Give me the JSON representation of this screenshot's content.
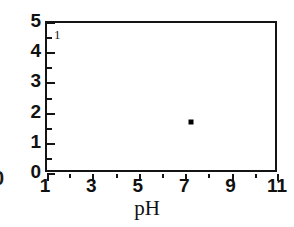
{
  "figure": {
    "panel_label": "1",
    "edge_remnant_text": "0",
    "marker_color": "#000000",
    "axis_color": "#141414",
    "background": "#ffffff"
  },
  "chart_data": {
    "type": "scatter",
    "title": "",
    "subtitle": "",
    "xlabel": "pH",
    "ylabel": "",
    "xlim": [
      1,
      11
    ],
    "ylim": [
      0,
      5
    ],
    "grid": false,
    "legend": null,
    "panel_label": "1",
    "x_major_ticks": [
      1,
      3,
      5,
      7,
      9,
      11
    ],
    "x_minor_ticks": [
      2,
      4,
      6,
      8,
      10
    ],
    "x_tick_labels": [
      "1",
      "3",
      "5",
      "7",
      "9",
      "11"
    ],
    "y_major_ticks": [
      0,
      1,
      2,
      3,
      4,
      5
    ],
    "y_minor_ticks": [
      0.5,
      1.5,
      2.5,
      3.5,
      4.5
    ],
    "y_tick_labels": [
      "0",
      "1",
      "2",
      "3",
      "4",
      "5"
    ],
    "series": [
      {
        "name": "data",
        "marker": "square",
        "points": [
          {
            "x": 7.2,
            "y": 1.72
          }
        ]
      }
    ]
  }
}
